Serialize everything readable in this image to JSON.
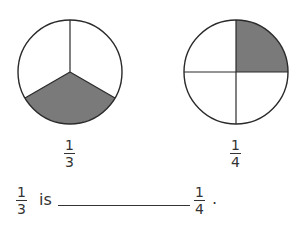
{
  "figures": [
    {
      "name": "circle-thirds",
      "parts": 3,
      "shaded_parts": 1,
      "shaded_region": "bottom",
      "label": {
        "numerator": "1",
        "denominator": "3"
      }
    },
    {
      "name": "circle-quarters",
      "parts": 4,
      "shaded_parts": 1,
      "shaded_region": "top-right",
      "label": {
        "numerator": "1",
        "denominator": "4"
      }
    }
  ],
  "sentence": {
    "left_fraction": {
      "numerator": "1",
      "denominator": "3"
    },
    "word": "is",
    "blank": "",
    "right_fraction": {
      "numerator": "1",
      "denominator": "4"
    },
    "end_punctuation": "."
  },
  "colors": {
    "shade": "#7a7a7a",
    "stroke": "#2a2a2a",
    "background": "#ffffff"
  }
}
